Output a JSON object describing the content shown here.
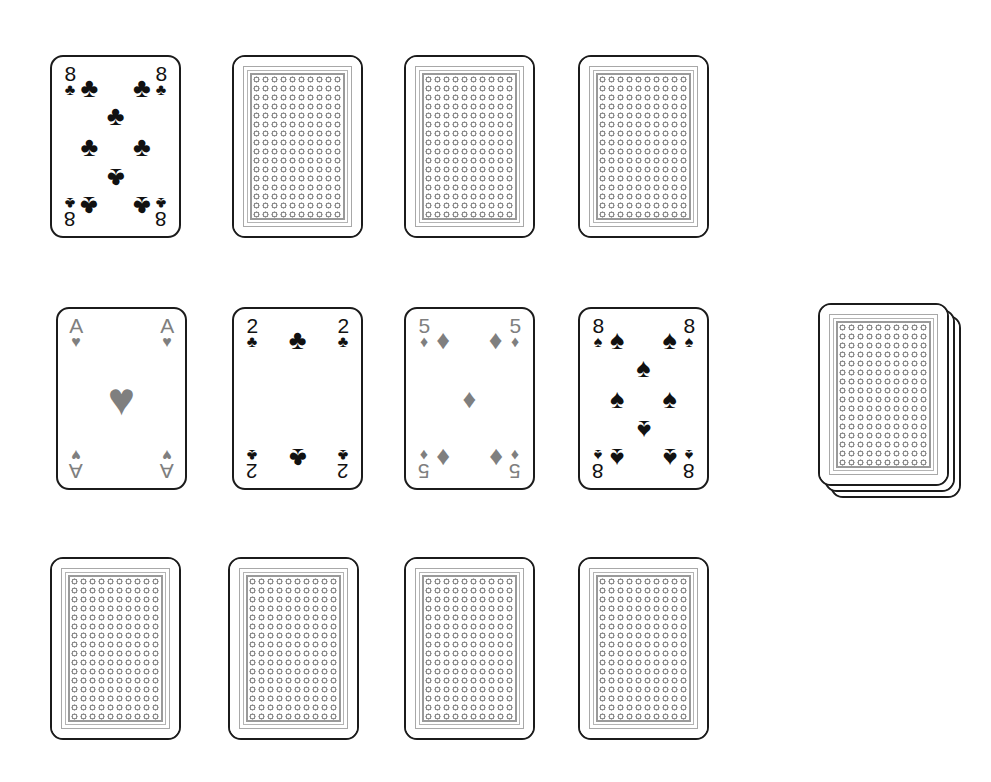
{
  "scene": {
    "title": "Solitaire card layout",
    "background_color": "#ffffff",
    "width": 991,
    "height": 782
  },
  "palette": {
    "card_face": "#ffffff",
    "card_border": "#1b1b1b",
    "black_suit": "#111111",
    "red_suit_rendered": "#7f7f7f",
    "back_pattern": "#8d8d8d",
    "back_frame": "#a8a8a8"
  },
  "glyphs": {
    "club": "♣",
    "spade": "♠",
    "heart": "♥",
    "diamond": "♦"
  },
  "card_size": {
    "width": 131,
    "height": 183
  },
  "rows": [
    {
      "name": "row-1",
      "y": 55,
      "cards": [
        {
          "id": "r1c1",
          "x": 50,
          "facing": "up",
          "rank": "8",
          "suit": "club",
          "suit_name": "clubs",
          "color": "black",
          "label": "8 of Clubs"
        },
        {
          "id": "r1c2",
          "x": 232,
          "facing": "down",
          "label": "Face-down card"
        },
        {
          "id": "r1c3",
          "x": 404,
          "facing": "down",
          "label": "Face-down card"
        },
        {
          "id": "r1c4",
          "x": 578,
          "facing": "down",
          "label": "Face-down card"
        }
      ]
    },
    {
      "name": "row-2",
      "y": 307,
      "cards": [
        {
          "id": "r2c1",
          "x": 56,
          "facing": "up",
          "rank": "A",
          "suit": "heart",
          "suit_name": "hearts",
          "color": "gray",
          "label": "Ace of Hearts"
        },
        {
          "id": "r2c2",
          "x": 232,
          "facing": "up",
          "rank": "2",
          "suit": "club",
          "suit_name": "clubs",
          "color": "black",
          "label": "2 of Clubs"
        },
        {
          "id": "r2c3",
          "x": 404,
          "facing": "up",
          "rank": "5",
          "suit": "diamond",
          "suit_name": "diamonds",
          "color": "gray",
          "label": "5 of Diamonds"
        },
        {
          "id": "r2c4",
          "x": 578,
          "facing": "up",
          "rank": "8",
          "suit": "spade",
          "suit_name": "spades",
          "color": "black",
          "label": "8 of Spades"
        }
      ],
      "deck": {
        "id": "stock-pile",
        "x": 818,
        "y": 303,
        "facing": "down",
        "cards_visible": 3,
        "label": "Stock pile"
      }
    },
    {
      "name": "row-3",
      "y": 557,
      "cards": [
        {
          "id": "r3c1",
          "x": 50,
          "facing": "down",
          "label": "Face-down card"
        },
        {
          "id": "r3c2",
          "x": 228,
          "facing": "down",
          "label": "Face-down card"
        },
        {
          "id": "r3c3",
          "x": 404,
          "facing": "down",
          "label": "Face-down card"
        },
        {
          "id": "r3c4",
          "x": 578,
          "facing": "down",
          "label": "Face-down card"
        }
      ]
    }
  ],
  "pip_layouts": {
    "A": [
      {
        "x": 50,
        "y": 50,
        "big": true,
        "inv": false
      }
    ],
    "2": [
      {
        "x": 50,
        "y": 11,
        "inv": false
      },
      {
        "x": 50,
        "y": 89,
        "inv": true
      }
    ],
    "5": [
      {
        "x": 15,
        "y": 11,
        "inv": false
      },
      {
        "x": 85,
        "y": 11,
        "inv": false
      },
      {
        "x": 50,
        "y": 50,
        "inv": false
      },
      {
        "x": 15,
        "y": 89,
        "inv": true
      },
      {
        "x": 85,
        "y": 89,
        "inv": true
      }
    ],
    "8": [
      {
        "x": 15,
        "y": 11,
        "inv": false
      },
      {
        "x": 85,
        "y": 11,
        "inv": false
      },
      {
        "x": 50,
        "y": 30,
        "inv": false
      },
      {
        "x": 15,
        "y": 50,
        "inv": false
      },
      {
        "x": 85,
        "y": 50,
        "inv": false
      },
      {
        "x": 50,
        "y": 70,
        "inv": true
      },
      {
        "x": 15,
        "y": 89,
        "inv": true
      },
      {
        "x": 85,
        "y": 89,
        "inv": true
      }
    ]
  }
}
